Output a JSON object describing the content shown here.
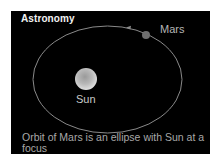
{
  "card": {
    "title": "Astronomy",
    "caption": "Orbit of Mars is an ellipse with Sun at a focus"
  },
  "diagram": {
    "orbit": {
      "shape": "ellipse",
      "cx": 107.5,
      "cy": 79.5,
      "rx": 74.5,
      "ry": 53.5,
      "stroke": "#8a8a8a",
      "direction": "counterclockwise"
    },
    "sun": {
      "label": "Sun",
      "cx": 86,
      "cy": 79,
      "r": 11,
      "color_light": "#d8d8d8",
      "color_dark": "#8c8c8c"
    },
    "mars": {
      "label": "Mars",
      "cx": 146,
      "cy": 35,
      "r": 4,
      "color": "#6e6e6e"
    },
    "arrow": {
      "icon": "arrow-left-icon",
      "x": 128,
      "y": 28
    }
  },
  "colors": {
    "background": "#ffffff",
    "panel": "#000000",
    "title_text": "#f2f2f2",
    "label_text": "#b5b5b5"
  }
}
